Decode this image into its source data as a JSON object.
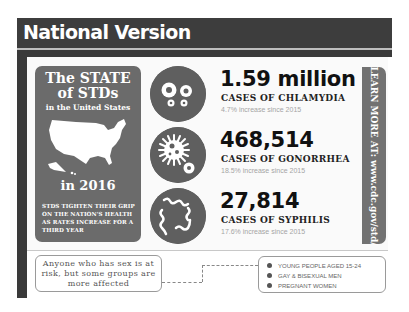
{
  "header": {
    "title": "National Version"
  },
  "state_box": {
    "title_line1": "The STATE",
    "title_line2": "of STDs",
    "subtitle": "in the United States",
    "map_icon": "us-map-icon",
    "year": "in 2016",
    "note": "STDS TIGHTEN THEIR GRIP ON THE NATION'S HEALTH AS RATES INCREASE FOR A THIRD YEAR"
  },
  "stats": [
    {
      "icon": "chlamydia-bacteria-icon",
      "value": "1.59 million",
      "label": "CASES OF CHLAMYDIA",
      "increase": "4.7% increase since 2015"
    },
    {
      "icon": "gonorrhea-bacteria-icon",
      "value": "468,514",
      "label": "CASES OF GONORRHEA",
      "increase": "18.5% increase since 2015"
    },
    {
      "icon": "syphilis-bacteria-icon",
      "value": "27,814",
      "label": "CASES OF SYPHILIS",
      "increase": "17.6% increase since 2015"
    }
  ],
  "learn_more": {
    "text": "LEARN MORE AT: www.cdc.gov/std/"
  },
  "callout": {
    "text": "Anyone who has sex is at risk, but some groups are more affected"
  },
  "groups": [
    "YOUNG PEOPLE AGED 15-24",
    "GAY & BISEXUAL MEN",
    "PREGNANT WOMEN"
  ],
  "colors": {
    "header_bg": "#3d3d3d",
    "box_gray": "#6b6b6b",
    "icon_circle": "#5f5f5f",
    "sidebar_gray": "#727272",
    "increase_text": "#a5a5a5"
  }
}
